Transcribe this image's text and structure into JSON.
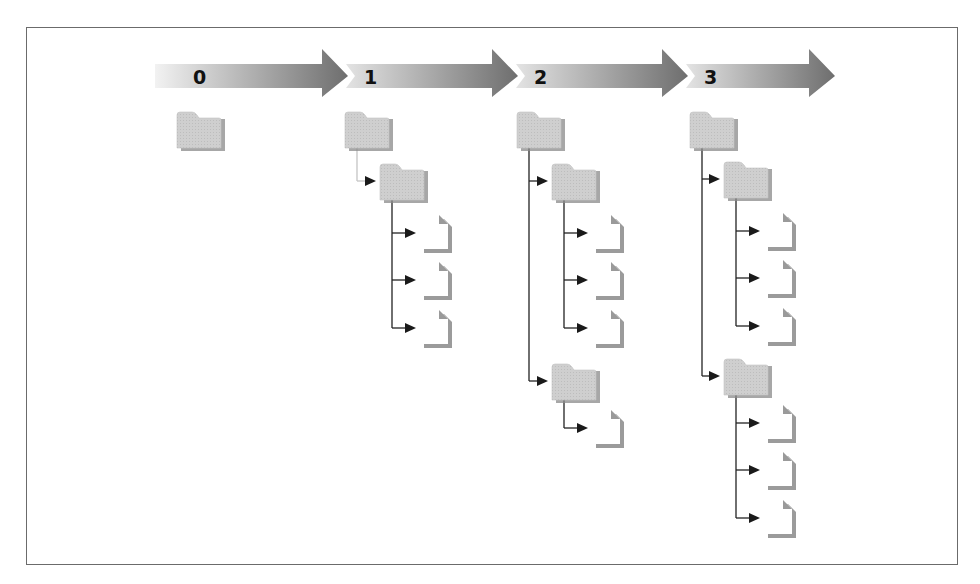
{
  "figure": {
    "colors": {
      "border": "#6b6b6b",
      "arrow_light": "#dcdcdc",
      "arrow_dark": "#7a7a7a",
      "folder_fill": "#cfcfcf",
      "folder_shadow": "#8a8a8a",
      "file_fill": "#ffffff",
      "file_shadow": "#8a8a8a",
      "connector": "#222222",
      "connector_faint": "#c4c4c4"
    }
  },
  "timeline": {
    "stages": [
      {
        "label": "0",
        "x_start": 155,
        "x_end": 348
      },
      {
        "label": "1",
        "x_start": 348,
        "x_end": 518
      },
      {
        "label": "2",
        "x_start": 518,
        "x_end": 688
      },
      {
        "label": "3",
        "x_start": 688,
        "x_end": 835
      }
    ]
  },
  "trees": [
    {
      "stage": "0",
      "root": {
        "type": "folder",
        "x": 177,
        "y": 113,
        "children": []
      }
    },
    {
      "stage": "1",
      "faint_link": true,
      "root": {
        "type": "folder",
        "x": 345,
        "y": 113,
        "children": [
          {
            "type": "folder",
            "x": 380,
            "y": 165,
            "children": [
              {
                "type": "file",
                "x": 420,
                "y": 215
              },
              {
                "type": "file",
                "x": 420,
                "y": 262
              },
              {
                "type": "file",
                "x": 420,
                "y": 310
              }
            ]
          }
        ]
      }
    },
    {
      "stage": "2",
      "root": {
        "type": "folder",
        "x": 517,
        "y": 113,
        "children": [
          {
            "type": "folder",
            "x": 552,
            "y": 165,
            "children": [
              {
                "type": "file",
                "x": 592,
                "y": 215
              },
              {
                "type": "file",
                "x": 592,
                "y": 262
              },
              {
                "type": "file",
                "x": 592,
                "y": 310
              }
            ]
          },
          {
            "type": "folder",
            "x": 552,
            "y": 365,
            "children": [
              {
                "type": "file",
                "x": 592,
                "y": 410
              }
            ]
          }
        ]
      }
    },
    {
      "stage": "3",
      "root": {
        "type": "folder",
        "x": 690,
        "y": 113,
        "children": [
          {
            "type": "folder",
            "x": 724,
            "y": 163,
            "children": [
              {
                "type": "file",
                "x": 764,
                "y": 213
              },
              {
                "type": "file",
                "x": 764,
                "y": 260
              },
              {
                "type": "file",
                "x": 764,
                "y": 308
              }
            ]
          },
          {
            "type": "folder",
            "x": 724,
            "y": 360,
            "children": [
              {
                "type": "file",
                "x": 764,
                "y": 405
              },
              {
                "type": "file",
                "x": 764,
                "y": 452
              },
              {
                "type": "file",
                "x": 764,
                "y": 500
              }
            ]
          }
        ]
      }
    }
  ]
}
